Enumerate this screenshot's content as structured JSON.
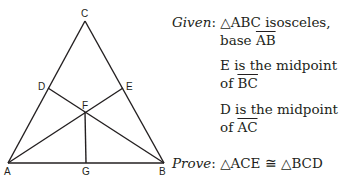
{
  "figure": {
    "vertices": {
      "A": {
        "label": "A",
        "x": 8,
        "y": 163
      },
      "B": {
        "label": "B",
        "x": 164,
        "y": 163
      },
      "C": {
        "label": "C",
        "x": 85,
        "y": 21
      },
      "D": {
        "label": "D",
        "x": 48,
        "y": 88
      },
      "E": {
        "label": "E",
        "x": 123,
        "y": 88
      },
      "F": {
        "label": "F",
        "x": 85,
        "y": 112
      },
      "G": {
        "label": "G",
        "x": 86,
        "y": 163
      }
    },
    "segments": [
      [
        "A",
        "B"
      ],
      [
        "B",
        "C"
      ],
      [
        "C",
        "A"
      ],
      [
        "A",
        "E"
      ],
      [
        "B",
        "D"
      ],
      [
        "F",
        "G"
      ]
    ],
    "line_color": "#231f20"
  },
  "given": {
    "label": "Given",
    "colon": ":",
    "line1_tri": "△ABC",
    "line1_rest": " isosceles,",
    "line2_pre": "base ",
    "line2_seg": "AB",
    "stmt2_line1": "E is the midpoint",
    "stmt2_pre": "of ",
    "stmt2_seg": "BC",
    "stmt3_line1": "D is the midpoint",
    "stmt3_pre": "of ",
    "stmt3_seg": "AC"
  },
  "prove": {
    "label": "Prove",
    "colon": ":",
    "statement": "△ACE ≅ △BCD"
  }
}
